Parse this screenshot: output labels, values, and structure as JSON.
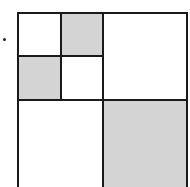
{
  "diagram": {
    "bullet": true,
    "colors": {
      "shaded": "#d4d4d4",
      "line": "#1a1a1a",
      "background": "#ffffff"
    },
    "cells": [
      {
        "id": "small-top-left",
        "shaded": false
      },
      {
        "id": "small-top-right",
        "shaded": true
      },
      {
        "id": "small-bottom-left",
        "shaded": true
      },
      {
        "id": "small-bottom-right",
        "shaded": false
      },
      {
        "id": "large-top-right",
        "shaded": false
      },
      {
        "id": "large-bottom-left",
        "shaded": false
      },
      {
        "id": "large-bottom-right",
        "shaded": true
      }
    ]
  }
}
